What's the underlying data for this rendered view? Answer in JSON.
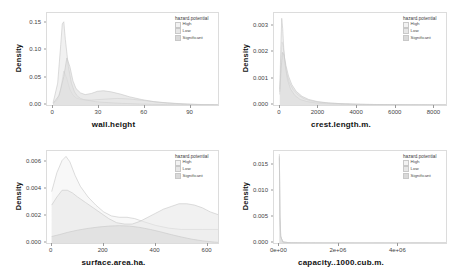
{
  "figure": {
    "ylabel": "Density",
    "legend_title": "hazard.potential",
    "legend_items": [
      {
        "label": "High",
        "color": "#f2f2f2"
      },
      {
        "label": "Low",
        "color": "#e6e6e6"
      },
      {
        "label": "Significant",
        "color": "#d9d9d9"
      }
    ]
  },
  "chart_data": [
    {
      "type": "area",
      "id": "wall-height",
      "title": "",
      "xlabel": "wall.height",
      "ylabel": "Density",
      "xticks": [
        0,
        30,
        60,
        90
      ],
      "xticklabels": [
        "0",
        "30",
        "60",
        "90"
      ],
      "yticks": [
        0.0,
        0.05,
        0.1,
        0.15
      ],
      "yticklabels": [
        "0.00",
        "0.05",
        "0.10",
        "0.15"
      ],
      "xlim": [
        -4,
        108
      ],
      "ylim": [
        0,
        0.168
      ],
      "grid": false,
      "legend_position": "top-right",
      "series": [
        {
          "name": "High",
          "x": [
            0,
            3,
            5,
            7,
            9,
            11,
            13,
            15,
            18,
            21,
            25,
            30,
            36,
            42,
            50,
            60,
            70,
            80,
            90,
            100,
            108
          ],
          "y": [
            0.002,
            0.01,
            0.03,
            0.062,
            0.048,
            0.028,
            0.018,
            0.013,
            0.01,
            0.009,
            0.009,
            0.01,
            0.011,
            0.012,
            0.011,
            0.008,
            0.005,
            0.003,
            0.0015,
            0.0006,
            0.0002
          ]
        },
        {
          "name": "Low",
          "x": [
            0,
            3,
            5,
            6,
            7,
            8,
            10,
            12,
            14,
            16,
            18,
            20,
            24,
            28,
            32,
            38,
            45,
            55,
            65,
            75,
            85,
            95,
            108
          ],
          "y": [
            0.004,
            0.04,
            0.11,
            0.148,
            0.152,
            0.12,
            0.07,
            0.04,
            0.024,
            0.016,
            0.012,
            0.01,
            0.008,
            0.006,
            0.005,
            0.004,
            0.003,
            0.002,
            0.0012,
            0.0007,
            0.0004,
            0.0002,
            0.0001
          ]
        },
        {
          "name": "Significant",
          "x": [
            0,
            4,
            7,
            9,
            11,
            13,
            15,
            18,
            21,
            25,
            29,
            33,
            38,
            44,
            50,
            58,
            66,
            75,
            85,
            95,
            108
          ],
          "y": [
            0.003,
            0.018,
            0.052,
            0.086,
            0.07,
            0.044,
            0.03,
            0.022,
            0.019,
            0.021,
            0.025,
            0.026,
            0.024,
            0.02,
            0.015,
            0.01,
            0.006,
            0.0035,
            0.0018,
            0.0008,
            0.0002
          ]
        }
      ]
    },
    {
      "type": "area",
      "id": "crest-length",
      "title": "",
      "xlabel": "crest.length.m.",
      "ylabel": "Density",
      "xticks": [
        0,
        2000,
        4000,
        6000,
        8000
      ],
      "xticklabels": [
        "0",
        "2000",
        "4000",
        "6000",
        "8000"
      ],
      "yticks": [
        0.0,
        0.001,
        0.002,
        0.003
      ],
      "yticklabels": [
        "0.000",
        "0.001",
        "0.002",
        "0.003"
      ],
      "xlim": [
        -300,
        8600
      ],
      "ylim": [
        0,
        0.0035
      ],
      "grid": false,
      "legend_position": "top-right",
      "series": [
        {
          "name": "High",
          "x": [
            0,
            60,
            120,
            180,
            250,
            350,
            500,
            700,
            950,
            1250,
            1600,
            2000,
            2600,
            3400,
            4400,
            5600,
            7000,
            8600
          ],
          "y": [
            0.0004,
            0.0016,
            0.0024,
            0.0022,
            0.0017,
            0.0012,
            0.00085,
            0.00058,
            0.00038,
            0.00024,
            0.00016,
            0.00011,
            7e-05,
            4e-05,
            2.2e-05,
            1.2e-05,
            6e-06,
            2e-06
          ]
        },
        {
          "name": "Low",
          "x": [
            0,
            50,
            100,
            150,
            200,
            280,
            400,
            560,
            780,
            1050,
            1400,
            1850,
            2400,
            3200,
            4200,
            5400,
            6800,
            8600
          ],
          "y": [
            0.0006,
            0.0021,
            0.0033,
            0.0029,
            0.0022,
            0.0015,
            0.00095,
            0.0006,
            0.00036,
            0.00021,
            0.00013,
            8e-05,
            5e-05,
            2.8e-05,
            1.5e-05,
            8e-06,
            4e-06,
            1e-06
          ]
        },
        {
          "name": "Significant",
          "x": [
            0,
            70,
            140,
            220,
            320,
            450,
            620,
            850,
            1150,
            1500,
            1950,
            2500,
            3200,
            4100,
            5200,
            6500,
            8600
          ],
          "y": [
            0.0005,
            0.0014,
            0.002,
            0.0019,
            0.0015,
            0.0011,
            0.00078,
            0.00052,
            0.00033,
            0.00021,
            0.00013,
            8e-05,
            5e-05,
            3e-05,
            1.6e-05,
            8e-06,
            2e-06
          ]
        }
      ]
    },
    {
      "type": "area",
      "id": "surface-area",
      "title": "",
      "xlabel": "surface.area.ha.",
      "ylabel": "Density",
      "xticks": [
        0,
        200,
        400,
        600
      ],
      "xticklabels": [
        "0",
        "200",
        "400",
        "600"
      ],
      "yticks": [
        0.0,
        0.002,
        0.004,
        0.006
      ],
      "yticklabels": [
        "0.000",
        "0.002",
        "0.004",
        "0.006"
      ],
      "xlim": [
        -18,
        640
      ],
      "ylim": [
        0,
        0.0068
      ],
      "grid": false,
      "legend_position": "top-right",
      "series": [
        {
          "name": "High",
          "x": [
            0,
            20,
            40,
            55,
            70,
            90,
            110,
            140,
            170,
            200,
            230,
            260,
            290,
            320,
            350,
            400,
            450,
            500,
            540,
            580,
            620,
            640
          ],
          "y": [
            0.0038,
            0.0052,
            0.0061,
            0.0064,
            0.006,
            0.005,
            0.0042,
            0.0034,
            0.0028,
            0.0023,
            0.002,
            0.0019,
            0.0019,
            0.0018,
            0.0016,
            0.0013,
            0.0011,
            0.001,
            0.001,
            0.001,
            0.001,
            0.001
          ]
        },
        {
          "name": "Low",
          "x": [
            0,
            20,
            40,
            60,
            80,
            100,
            130,
            160,
            190,
            220,
            250,
            280,
            310,
            340,
            370,
            400,
            430,
            460,
            490,
            520,
            550,
            580,
            610,
            640
          ],
          "y": [
            0.0028,
            0.0034,
            0.0039,
            0.0039,
            0.0037,
            0.0034,
            0.003,
            0.0026,
            0.0022,
            0.0018,
            0.0015,
            0.0014,
            0.0014,
            0.0016,
            0.0019,
            0.0022,
            0.0025,
            0.0027,
            0.0029,
            0.0029,
            0.0028,
            0.0026,
            0.0023,
            0.0021
          ]
        },
        {
          "name": "Significant",
          "x": [
            0,
            30,
            60,
            100,
            140,
            180,
            220,
            260,
            300,
            340,
            380,
            420,
            460,
            500,
            540,
            580,
            620,
            640
          ],
          "y": [
            0.00048,
            0.00062,
            0.00078,
            0.00095,
            0.00108,
            0.00118,
            0.00125,
            0.00128,
            0.00125,
            0.00115,
            0.001,
            0.00082,
            0.00062,
            0.00044,
            0.00028,
            0.00016,
            8e-05,
            5e-05
          ]
        }
      ]
    },
    {
      "type": "area",
      "id": "capacity",
      "title": "",
      "xlabel": "capacity..1000.cub.m.",
      "ylabel": "Density",
      "xticks": [
        0,
        2000000,
        4000000
      ],
      "xticklabels": [
        "0e+00",
        "2e+06",
        "4e+06"
      ],
      "yticks": [
        0.0,
        0.005,
        0.01,
        0.015
      ],
      "yticklabels": [
        "0.000",
        "0.005",
        "0.010",
        "0.015"
      ],
      "xlim": [
        -180000,
        5600000
      ],
      "ylim": [
        0,
        0.0178
      ],
      "grid": false,
      "legend_position": "top-right",
      "series": [
        {
          "name": "High",
          "x": [
            0,
            9000,
            20000,
            45000,
            120000,
            400000,
            1200000,
            3000000,
            5600000
          ],
          "y": [
            0.0168,
            0.012,
            0.005,
            0.0012,
            0.00018,
            3e-05,
            8e-06,
            2e-06,
            5e-07
          ]
        },
        {
          "name": "Low",
          "x": [
            0,
            8000,
            18000,
            40000,
            110000,
            380000,
            1100000,
            2800000,
            5600000
          ],
          "y": [
            0.0172,
            0.0125,
            0.0055,
            0.0014,
            0.0002,
            3e-05,
            8e-06,
            2e-06,
            5e-07
          ]
        },
        {
          "name": "Significant",
          "x": [
            0,
            10000,
            22000,
            50000,
            130000,
            420000,
            1300000,
            3200000,
            5600000
          ],
          "y": [
            0.0165,
            0.0115,
            0.0048,
            0.0011,
            0.00016,
            2.5e-05,
            7e-06,
            2e-06,
            5e-07
          ]
        }
      ]
    }
  ]
}
